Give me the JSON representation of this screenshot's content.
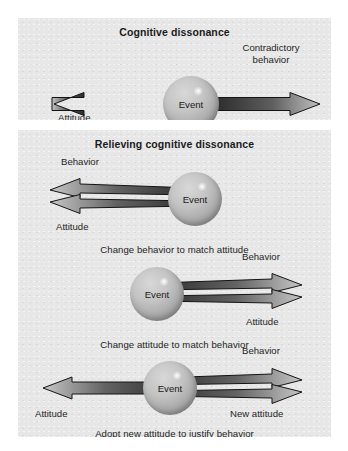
{
  "figure": {
    "panels": [
      {
        "id": "cognitive-dissonance",
        "title": "Cognitive dissonance",
        "diagrams": [
          {
            "id": "dissonance",
            "sphere_label": "Event",
            "labels": {
              "left": "Attitude",
              "right_line1": "Contradictory",
              "right_line2": "behavior"
            },
            "caption": ""
          }
        ]
      },
      {
        "id": "relieving-cognitive-dissonance",
        "title": "Relieving cognitive dissonance",
        "diagrams": [
          {
            "id": "change-behavior",
            "sphere_label": "Event",
            "labels": {
              "upper_left": "Behavior",
              "lower_left": "Attitude"
            },
            "caption": "Change behavior to match attitude"
          },
          {
            "id": "change-attitude",
            "sphere_label": "Event",
            "labels": {
              "upper_right": "Behavior",
              "lower_right": "Attitude"
            },
            "caption": "Change attitude to match behavior"
          },
          {
            "id": "adopt-new-attitude",
            "sphere_label": "Event",
            "labels": {
              "upper_right": "Behavior",
              "lower_left": "Attitude",
              "lower_right": "New attitude"
            },
            "caption": "Adopt new attitude to justify behavior"
          }
        ]
      }
    ]
  },
  "colors": {
    "panel_background": "#e7e7e7",
    "page_background": "#ffffff",
    "arrow_dark": "#2f2f2f",
    "arrow_light": "#b9b9b9",
    "arrow_outline": "#1a1a1a",
    "text": "#1f1f1f",
    "sphere_light": "#d8d8d8",
    "sphere_dark": "#8f8f8f"
  }
}
